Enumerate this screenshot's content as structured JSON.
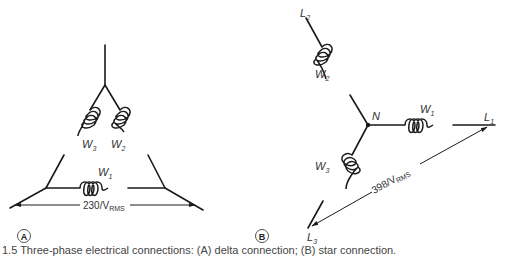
{
  "panel_a": {
    "badge": "A",
    "title": "delta connection",
    "windings": {
      "w1": "W",
      "w1_sub": "1",
      "w2": "W",
      "w2_sub": "2",
      "w3": "W",
      "w3_sub": "3"
    },
    "voltage_main": "230/V",
    "voltage_sub": "RMS"
  },
  "panel_b": {
    "badge": "B",
    "title": "star connection",
    "neutral": "N",
    "lines": {
      "l1": "L",
      "l1_sub": "1",
      "l2": "L",
      "l2_sub": "2",
      "l3": "L",
      "l3_sub": "3"
    },
    "windings": {
      "w1": "W",
      "w1_sub": "1",
      "w2": "W",
      "w2_sub": "2",
      "w3": "W",
      "w3_sub": "3"
    },
    "voltage_main": "398/V",
    "voltage_sub": "RMS"
  },
  "caption": "1.5 Three-phase electrical connections: (A) delta connection; (B) star connection."
}
